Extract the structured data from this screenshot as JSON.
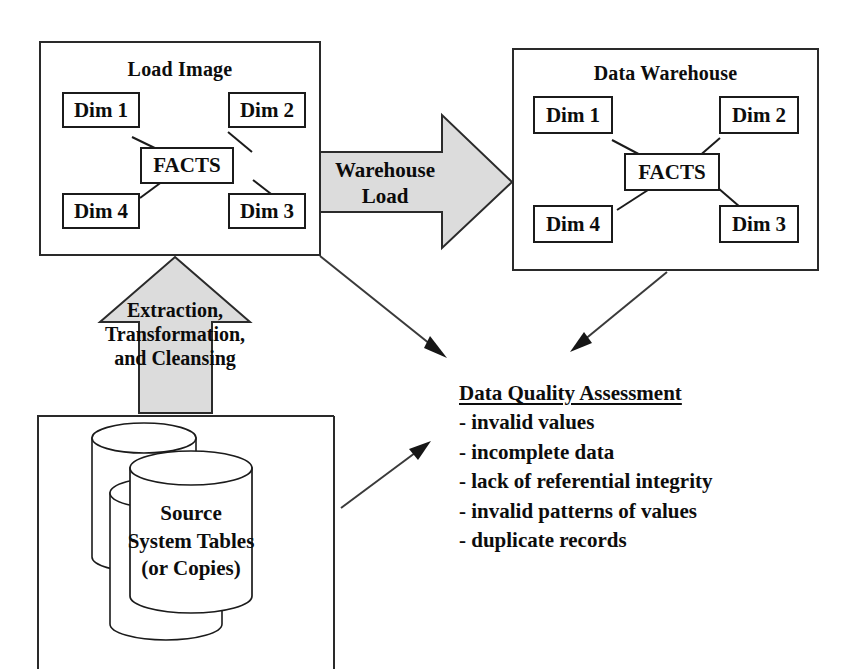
{
  "load_image": {
    "title": "Load Image",
    "fact_label": "FACTS",
    "dims": [
      {
        "label": "Dim 1"
      },
      {
        "label": "Dim 2"
      },
      {
        "label": "Dim 3"
      },
      {
        "label": "Dim 4"
      }
    ]
  },
  "data_warehouse": {
    "title": "Data Warehouse",
    "fact_label": "FACTS",
    "dims": [
      {
        "label": "Dim 1"
      },
      {
        "label": "Dim 2"
      },
      {
        "label": "Dim 3"
      },
      {
        "label": "Dim 4"
      }
    ]
  },
  "warehouse_load_arrow": {
    "line1": "Warehouse",
    "line2": "Load"
  },
  "etc_arrow": {
    "line1": "Extraction,",
    "line2": "Transformation,",
    "line3": "and Cleansing"
  },
  "source_systems": {
    "line1": "Source",
    "line2": "System Tables",
    "line3": "(or Copies)"
  },
  "data_quality": {
    "title": "Data Quality Assessment",
    "items": [
      "- invalid values",
      "- incomplete data",
      "- lack of referential integrity",
      "- invalid patterns of values",
      "- duplicate records"
    ]
  },
  "colors": {
    "stroke": "#1b1b1b",
    "arrow_fill": "#d9d9d9",
    "background": "#ffffff",
    "text": "#0d0d0d"
  }
}
